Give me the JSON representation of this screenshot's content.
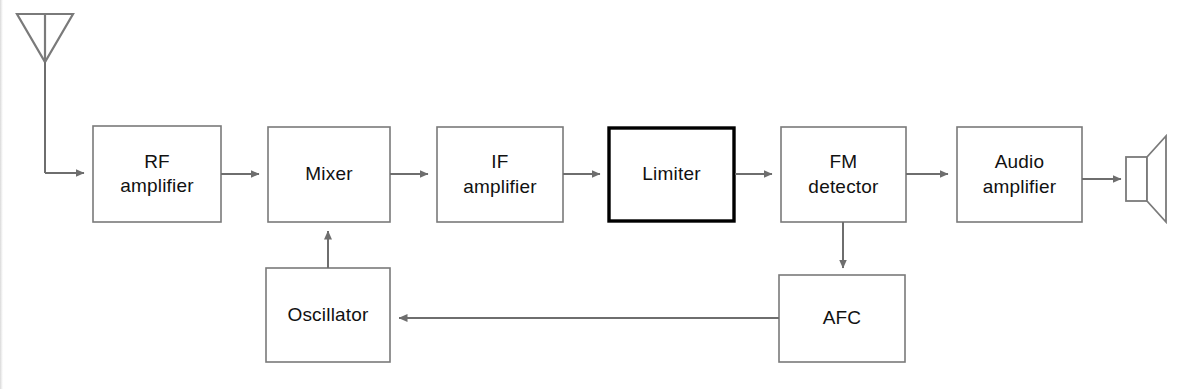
{
  "diagram": {
    "type": "block-diagram",
    "colors": {
      "background": "#ffffff",
      "block_stroke": "#7a7a7a",
      "highlight_stroke": "#000000",
      "line": "#6e6e6e",
      "text": "#111111"
    },
    "blocks": [
      {
        "id": "rf-amplifier",
        "label": "RF\namplifier",
        "x": 93,
        "y": 126,
        "w": 128,
        "h": 96,
        "highlighted": false
      },
      {
        "id": "mixer",
        "label": "Mixer",
        "x": 268,
        "y": 127,
        "w": 122,
        "h": 95,
        "highlighted": false
      },
      {
        "id": "if-amplifier",
        "label": "IF\namplifier",
        "x": 437,
        "y": 127,
        "w": 126,
        "h": 95,
        "highlighted": false
      },
      {
        "id": "limiter",
        "label": "Limiter",
        "x": 608,
        "y": 127,
        "w": 127,
        "h": 95,
        "highlighted": true
      },
      {
        "id": "fm-detector",
        "label": "FM\ndetector",
        "x": 781,
        "y": 127,
        "w": 125,
        "h": 95,
        "highlighted": false
      },
      {
        "id": "audio-amplifier",
        "label": "Audio\namplifier",
        "x": 957,
        "y": 127,
        "w": 125,
        "h": 95,
        "highlighted": false
      },
      {
        "id": "oscillator",
        "label": "Oscillator",
        "x": 266,
        "y": 268,
        "w": 124,
        "h": 94,
        "highlighted": false
      },
      {
        "id": "afc",
        "label": "AFC",
        "x": 779,
        "y": 275,
        "w": 126,
        "h": 87,
        "highlighted": false
      }
    ],
    "symbols": [
      {
        "id": "antenna",
        "name": "antenna-symbol",
        "description": "inverted triangle dipole antenna with vertical feed line"
      },
      {
        "id": "loudspeaker",
        "name": "loudspeaker-symbol",
        "description": "rectangle driver with flaring cone"
      }
    ],
    "connections": [
      {
        "id": "antenna-to-rf",
        "from": "antenna",
        "to": "rf-amplifier",
        "arrow": true
      },
      {
        "id": "rf-to-mixer",
        "from": "rf-amplifier",
        "to": "mixer",
        "arrow": true
      },
      {
        "id": "mixer-to-if",
        "from": "mixer",
        "to": "if-amplifier",
        "arrow": true
      },
      {
        "id": "if-to-limiter",
        "from": "if-amplifier",
        "to": "limiter",
        "arrow": true
      },
      {
        "id": "limiter-to-fm",
        "from": "limiter",
        "to": "fm-detector",
        "arrow": true
      },
      {
        "id": "fm-to-audio",
        "from": "fm-detector",
        "to": "audio-amplifier",
        "arrow": true
      },
      {
        "id": "audio-to-speaker",
        "from": "audio-amplifier",
        "to": "loudspeaker",
        "arrow": true
      },
      {
        "id": "fm-to-afc",
        "from": "fm-detector",
        "to": "afc",
        "arrow": true
      },
      {
        "id": "afc-to-oscillator",
        "from": "afc",
        "to": "oscillator",
        "arrow": true
      },
      {
        "id": "oscillator-to-mixer",
        "from": "oscillator",
        "to": "mixer",
        "arrow": true
      }
    ]
  }
}
